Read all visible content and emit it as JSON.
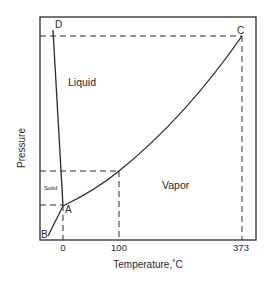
{
  "diagram": {
    "regions": {
      "liquid": "Liquid",
      "vapor": "Vapor",
      "solid": "Solid"
    },
    "points": {
      "A": "A",
      "B": "B",
      "C": "C",
      "D": "D"
    },
    "axes": {
      "xlabel": "Temperature,˚C",
      "ylabel": "Pressure",
      "xticks": [
        "0",
        "100",
        "373"
      ]
    },
    "colors": {
      "line": "#2a2a2a",
      "background": "#ffffff"
    }
  }
}
